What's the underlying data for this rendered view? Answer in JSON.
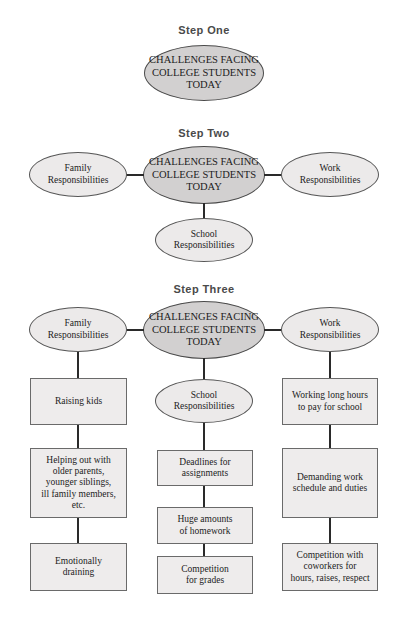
{
  "document": {
    "title": "Challenges Facing College Students Today — Clustering Diagram",
    "type": "three-step clustering / mind-map diagram"
  },
  "colors": {
    "page_background": "#ffffff",
    "central_oval_fill": "#d2d0d0",
    "branch_oval_fill": "#eceaea",
    "box_fill": "#eeecec",
    "border": "#565656",
    "connector": "#2a2a2a",
    "step_label_text": "#4a4a4a",
    "body_text": "#1c1c1c"
  },
  "steps": [
    {
      "id": "step-one",
      "label": "Step One"
    },
    {
      "id": "step-two",
      "label": "Step Two"
    },
    {
      "id": "step-three",
      "label": "Step Three"
    }
  ],
  "topic": "CHALLENGES FACING\nCOLLEGE STUDENTS\nTODAY",
  "step_one": {
    "label": "Step One",
    "center": "CHALLENGES FACING\nCOLLEGE STUDENTS\nTODAY"
  },
  "step_two": {
    "label": "Step Two",
    "center": "CHALLENGES FACING\nCOLLEGE STUDENTS\nTODAY",
    "branches": [
      {
        "position": "left",
        "label": "Family\nResponsibilities"
      },
      {
        "position": "right",
        "label": "Work\nResponsibilities"
      },
      {
        "position": "bottom",
        "label": "School\nResponsibilities"
      }
    ]
  },
  "step_three": {
    "label": "Step Three",
    "center": "CHALLENGES FACING\nCOLLEGE STUDENTS\nTODAY",
    "columns": [
      {
        "position": "left",
        "heading": "Family\nResponsibilities",
        "items": [
          "Raising kids",
          "Helping out with\nolder parents,\nyounger siblings,\nill family members,\netc.",
          "Emotionally\ndraining"
        ]
      },
      {
        "position": "center",
        "heading": "School\nResponsibilities",
        "items": [
          "Deadlines for\nassignments",
          "Huge amounts\nof homework",
          "Competition\nfor grades"
        ]
      },
      {
        "position": "right",
        "heading": "Work\nResponsibilities",
        "items": [
          "Working long hours\nto pay for school",
          "Demanding work\nschedule and duties",
          "Competition with\ncoworkers for\nhours, raises, respect"
        ]
      }
    ]
  }
}
